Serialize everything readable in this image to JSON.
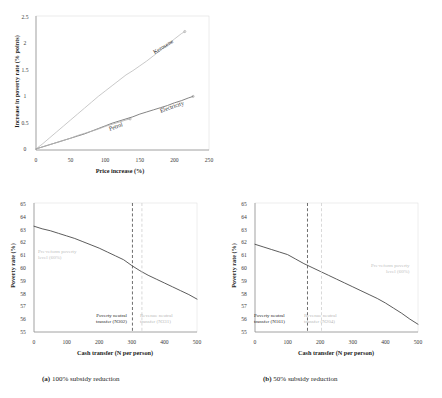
{
  "figure": {
    "captions": [
      {
        "tag": "(a)",
        "text": "100% subsidy reduction"
      },
      {
        "tag": "(b)",
        "text": "50% subsidy reduction"
      }
    ]
  },
  "chart_data": [
    {
      "id": "top-panel",
      "type": "line",
      "title": "",
      "xlabel": "Price increase (%)",
      "ylabel": "Increase in poverty rate (% points)",
      "xlim": [
        0,
        250
      ],
      "ylim": [
        0,
        2.5
      ],
      "xticks": [
        "0",
        "50",
        "100",
        "150",
        "200",
        "250"
      ],
      "yticks": [
        "0",
        "0.5",
        "1",
        "1.5",
        "2",
        "2.5"
      ],
      "grid": false,
      "legend": "inline-labels",
      "series": [
        {
          "name": "Kerosene",
          "color": "#bfbfbf",
          "label_x": 168,
          "label_y": 1.62,
          "label_rotate": -32,
          "x": [
            0,
            10,
            20,
            30,
            40,
            50,
            60,
            70,
            80,
            90,
            100,
            110,
            120,
            130,
            140,
            150,
            160,
            170,
            180,
            190,
            200,
            210,
            215
          ],
          "y": [
            0.02,
            0.12,
            0.23,
            0.34,
            0.45,
            0.56,
            0.67,
            0.78,
            0.89,
            1.0,
            1.1,
            1.2,
            1.3,
            1.4,
            1.48,
            1.57,
            1.66,
            1.76,
            1.86,
            1.96,
            2.07,
            2.17,
            2.21
          ]
        },
        {
          "name": "Electricity",
          "color": "#6e6e6e",
          "label_x": 176,
          "label_y": 0.78,
          "label_rotate": -19,
          "x": [
            0,
            10,
            20,
            30,
            40,
            50,
            60,
            70,
            80,
            90,
            100,
            110,
            120,
            130,
            140,
            150,
            160,
            170,
            180,
            190,
            200,
            210,
            220,
            227
          ],
          "y": [
            0.02,
            0.06,
            0.1,
            0.14,
            0.18,
            0.22,
            0.26,
            0.3,
            0.35,
            0.4,
            0.45,
            0.5,
            0.54,
            0.58,
            0.62,
            0.67,
            0.71,
            0.75,
            0.79,
            0.83,
            0.88,
            0.92,
            0.97,
            1.0
          ]
        },
        {
          "name": "Petrol",
          "color": "#b3b3b3",
          "label_x": 108,
          "label_y": 0.3,
          "label_rotate": -19,
          "x": [
            0,
            10,
            20,
            30,
            40,
            50,
            60,
            70,
            80,
            90,
            100,
            110,
            120,
            130,
            136
          ],
          "y": [
            0.02,
            0.06,
            0.1,
            0.14,
            0.18,
            0.22,
            0.27,
            0.31,
            0.35,
            0.39,
            0.44,
            0.48,
            0.52,
            0.56,
            0.58
          ]
        }
      ],
      "endpoint_markers": [
        {
          "x": 215,
          "y": 2.21
        },
        {
          "x": 227,
          "y": 1.0
        },
        {
          "x": 136,
          "y": 0.58
        }
      ]
    },
    {
      "id": "bottom-left-panel",
      "type": "line",
      "title": "",
      "subcaption": "(a) 100% subsidy reduction",
      "xlabel": "Cash transfer (N per person)",
      "ylabel": "Poverty rate (%)",
      "xlim": [
        0,
        500
      ],
      "ylim": [
        55,
        65
      ],
      "xticks": [
        "0",
        "100",
        "200",
        "300",
        "400",
        "500"
      ],
      "yticks": [
        "55",
        "56",
        "57",
        "58",
        "59",
        "60",
        "61",
        "62",
        "63",
        "64",
        "65"
      ],
      "grid": false,
      "series": [
        {
          "name": "Poverty rate after transfer",
          "color": "#4a4a4a",
          "x": [
            0,
            25,
            50,
            75,
            100,
            125,
            150,
            175,
            200,
            225,
            250,
            275,
            300,
            325,
            350,
            375,
            400,
            425,
            450,
            475,
            500
          ],
          "y": [
            63.2,
            63.0,
            62.85,
            62.65,
            62.45,
            62.25,
            62.0,
            61.75,
            61.5,
            61.2,
            60.9,
            60.6,
            60.15,
            59.75,
            59.4,
            59.1,
            58.8,
            58.5,
            58.2,
            57.9,
            57.55
          ]
        }
      ],
      "vlines": [
        {
          "x": 302,
          "style": "dark",
          "label": [
            "Poverty neutral",
            "transfer (N302)"
          ],
          "label_color": "#2b2b2b"
        },
        {
          "x": 331,
          "style": "grey",
          "label": [
            "Revenue neutral",
            "transfer (N331)"
          ],
          "label_color": "#c2c2c2"
        }
      ],
      "annotations": [
        {
          "text": [
            "Pre-reform poverty",
            "level (60%)"
          ],
          "x": 40,
          "y": 60.9,
          "color": "#c2c2c2"
        }
      ]
    },
    {
      "id": "bottom-right-panel",
      "type": "line",
      "title": "",
      "subcaption": "(b) 50% subsidy reduction",
      "xlabel": "Cash transfer (N per person)",
      "ylabel": "Poverty rate (%)",
      "xlim": [
        0,
        500
      ],
      "ylim": [
        55,
        65
      ],
      "xticks": [
        "0",
        "100",
        "200",
        "300",
        "400",
        "500"
      ],
      "yticks": [
        "55",
        "56",
        "57",
        "58",
        "59",
        "60",
        "61",
        "62",
        "63",
        "64",
        "65"
      ],
      "grid": false,
      "series": [
        {
          "name": "Poverty rate after transfer",
          "color": "#4a4a4a",
          "x": [
            0,
            25,
            50,
            75,
            100,
            125,
            150,
            175,
            200,
            225,
            250,
            275,
            300,
            325,
            350,
            375,
            400,
            425,
            450,
            475,
            500
          ],
          "y": [
            61.8,
            61.6,
            61.4,
            61.2,
            61.0,
            60.65,
            60.3,
            60.0,
            59.7,
            59.4,
            59.1,
            58.8,
            58.5,
            58.2,
            57.9,
            57.6,
            57.25,
            56.85,
            56.45,
            56.0,
            55.6
          ]
        }
      ],
      "vlines": [
        {
          "x": 161,
          "style": "dark",
          "label": [
            "Poverty neutral",
            "transfer (N161)"
          ],
          "label_color": "#2b2b2b"
        },
        {
          "x": 204,
          "style": "grey",
          "label": [
            "Revenue neutral",
            "transfer (N204)"
          ],
          "label_color": "#c2c2c2"
        }
      ],
      "annotations": [
        {
          "text": [
            "Pre-reform poverty",
            "level (60%)"
          ],
          "x": 355,
          "y": 60.9,
          "color": "#c2c2c2"
        }
      ]
    }
  ]
}
